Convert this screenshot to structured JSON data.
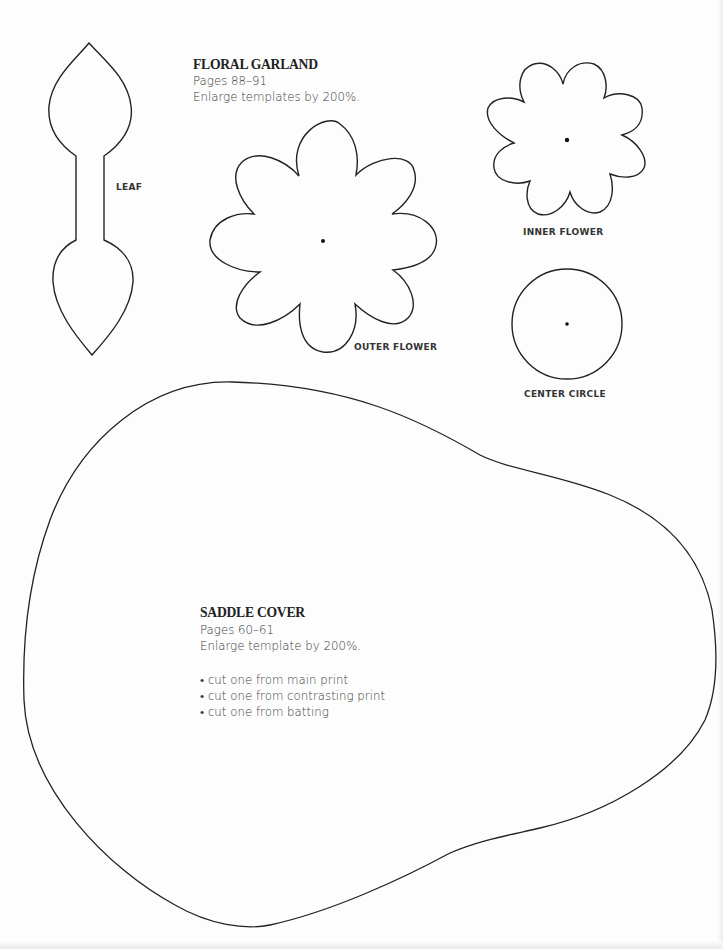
{
  "floral_garland": {
    "title": "FLORAL GARLAND",
    "pages": "Pages 88–91",
    "instruction": "Enlarge templates by 200%.",
    "templates": [
      {
        "label": "LEAF"
      },
      {
        "label": "OUTER FLOWER"
      },
      {
        "label": "INNER FLOWER"
      },
      {
        "label": "CENTER CIRCLE"
      }
    ]
  },
  "saddle_cover": {
    "title": "SADDLE COVER",
    "pages": "Pages 60–61",
    "instruction": "Enlarge template by 200%.",
    "cut_list": [
      "• cut one from main print",
      "• cut one from contrasting print",
      "• cut one from batting"
    ]
  },
  "colors": {
    "outline": "#222222",
    "paper": "#fdfdfd",
    "text": "#2b2b2b"
  }
}
